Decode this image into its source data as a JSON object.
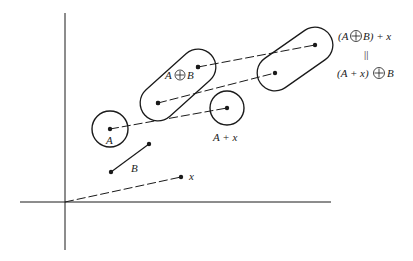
{
  "figure": {
    "labels": {
      "A": "A",
      "B": "B",
      "x": "x",
      "A_plus_x": "A + x",
      "A_dilate_B_left": "A",
      "A_dilate_B_right": "B",
      "eq_top_left": "(A",
      "eq_top_right": "B) + x",
      "eq_equals": "||",
      "eq_bottom_left": "(A + x)",
      "eq_bottom_right": "B"
    },
    "colors": {
      "stroke": "#1a1a1a",
      "background": "#ffffff"
    },
    "geometry": {
      "origin": [
        65,
        202
      ],
      "x_point": [
        181,
        177
      ],
      "B_segment": [
        [
          111,
          172
        ],
        [
          149,
          144
        ]
      ],
      "A_circle": {
        "center": [
          110,
          129
        ],
        "r": 18
      },
      "A_plus_x_circle": {
        "center": [
          227,
          108
        ],
        "r": 17
      },
      "A_dilate_B_capsule": {
        "p1": [
          158,
          103
        ],
        "p2": [
          198,
          67
        ],
        "r": 18
      },
      "translated_capsule": {
        "p1": [
          275,
          73
        ],
        "p2": [
          315,
          45
        ],
        "r": 18
      }
    }
  }
}
